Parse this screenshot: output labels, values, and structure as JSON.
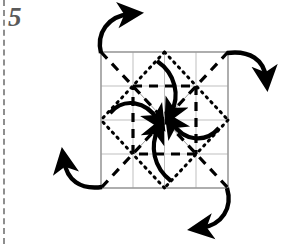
{
  "page": {
    "step_label": "5",
    "width": 282,
    "height": 244,
    "background_color": "#ffffff"
  },
  "binding": {
    "name": "notebook-binding-edge",
    "style": "dashed",
    "color": "#8e8e8e",
    "x": 3
  },
  "diagram": {
    "type": "origami-fold-instruction",
    "square": {
      "left": 101,
      "top": 52,
      "right": 228,
      "bottom": 188,
      "stroke_color": "#9a9a9a",
      "stroke_width": 1.4
    },
    "center": {
      "x": 164.5,
      "y": 120
    },
    "grid": {
      "divisions": 4,
      "color": "#b8b8b8",
      "stroke_width": 0.9,
      "x_lines": [
        133,
        164.5,
        196
      ],
      "y_lines": [
        86,
        120,
        154
      ]
    },
    "legend": {
      "solid_line": "paper edge",
      "gray_thin_line": "existing crease",
      "dashed_bold_line": "valley fold",
      "dotted_bold_line": "mountain fold",
      "curved_arrow": "fold direction"
    },
    "fold_lines": {
      "dashed": {
        "color": "#000000",
        "stroke_width": 3.2,
        "dash": "9 7",
        "description": "valley folds along both main diagonals and the inner quarter square",
        "segments": [
          {
            "name": "diagonal-tl-br",
            "x1": 101,
            "y1": 52,
            "x2": 228,
            "y2": 188
          },
          {
            "name": "diagonal-tr-bl",
            "x1": 228,
            "y1": 52,
            "x2": 101,
            "y2": 188
          },
          {
            "name": "inner-square-top",
            "x1": 133,
            "y1": 86,
            "x2": 196,
            "y2": 86
          },
          {
            "name": "inner-square-right",
            "x1": 196,
            "y1": 86,
            "x2": 196,
            "y2": 154
          },
          {
            "name": "inner-square-bottom",
            "x1": 196,
            "y1": 154,
            "x2": 133,
            "y2": 154
          },
          {
            "name": "inner-square-left",
            "x1": 133,
            "y1": 154,
            "x2": 133,
            "y2": 86
          }
        ]
      },
      "dotted": {
        "color": "#000000",
        "stroke_width": 3.0,
        "dash": "1.6 5.2",
        "description": "mountain folds forming the rotated diamond through the edge midpoints",
        "segments": [
          {
            "name": "diamond-top-left",
            "x1": 164.5,
            "y1": 52,
            "x2": 101,
            "y2": 120
          },
          {
            "name": "diamond-top-right",
            "x1": 164.5,
            "y1": 52,
            "x2": 228,
            "y2": 120
          },
          {
            "name": "diamond-bottom-right",
            "x1": 228,
            "y1": 120,
            "x2": 164.5,
            "y2": 188
          },
          {
            "name": "diamond-bottom-left",
            "x1": 164.5,
            "y1": 188,
            "x2": 101,
            "y2": 120
          }
        ]
      },
      "thin_creases": {
        "color": "#9a9a9a",
        "stroke_width": 1.0,
        "description": "existing light creases from center to the inner square corners",
        "segments": [
          {
            "name": "crease-center-to-inner-tl",
            "x1": 164.5,
            "y1": 120,
            "x2": 133,
            "y2": 86
          },
          {
            "name": "crease-center-to-inner-tr",
            "x1": 164.5,
            "y1": 120,
            "x2": 196,
            "y2": 86
          },
          {
            "name": "crease-center-to-inner-br",
            "x1": 164.5,
            "y1": 120,
            "x2": 196,
            "y2": 154
          },
          {
            "name": "crease-center-to-inner-bl",
            "x1": 164.5,
            "y1": 120,
            "x2": 133,
            "y2": 154
          }
        ]
      }
    },
    "inner_arrows": {
      "count": 4,
      "color": "#000000",
      "stroke_width": 4.2,
      "description": "four bold curved arrows converging on the center point",
      "items": [
        {
          "name": "inner-arrow-from-top",
          "start": {
            "x": 157,
            "y": 61
          },
          "end": {
            "x": 170,
            "y": 116
          }
        },
        {
          "name": "inner-arrow-from-left",
          "start": {
            "x": 110,
            "y": 113
          },
          "end": {
            "x": 159,
            "y": 123
          }
        },
        {
          "name": "inner-arrow-from-right",
          "start": {
            "x": 219,
            "y": 128
          },
          "end": {
            "x": 170,
            "y": 124
          }
        },
        {
          "name": "inner-arrow-from-bottom",
          "start": {
            "x": 171,
            "y": 181
          },
          "end": {
            "x": 159,
            "y": 127
          }
        }
      ]
    },
    "outer_arrows": {
      "count": 4,
      "color": "#000000",
      "stroke_width": 4.4,
      "description": "four bold curved arrows leaving the square corners outward",
      "items": [
        {
          "name": "outer-arrow-top-left",
          "start": {
            "x": 101,
            "y": 52
          },
          "end": {
            "x": 135,
            "y": 13
          }
        },
        {
          "name": "outer-arrow-top-right",
          "start": {
            "x": 228,
            "y": 52
          },
          "end": {
            "x": 270,
            "y": 82
          }
        },
        {
          "name": "outer-arrow-bottom-left",
          "start": {
            "x": 101,
            "y": 188
          },
          "end": {
            "x": 60,
            "y": 155
          }
        },
        {
          "name": "outer-arrow-bottom-right",
          "start": {
            "x": 228,
            "y": 188
          },
          "end": {
            "x": 197,
            "y": 231
          }
        }
      ]
    }
  }
}
